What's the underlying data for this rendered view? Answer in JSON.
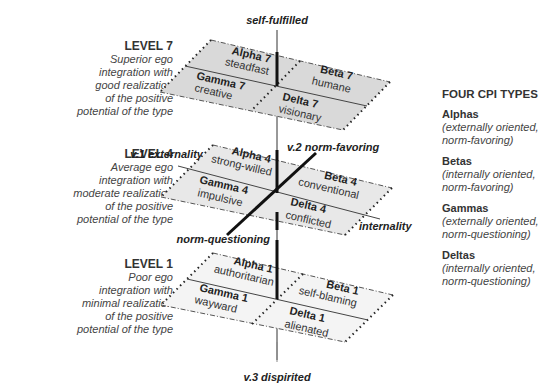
{
  "levels": [
    {
      "title": "LEVEL 7",
      "desc": [
        "Superior ego",
        "integration with",
        "good realization",
        "of the positive",
        "potential of the type"
      ]
    },
    {
      "title": "LEVEL 4",
      "desc": [
        "Average ego",
        "integration with",
        "moderate realization",
        "of the positive",
        "potential of the type"
      ]
    },
    {
      "title": "LEVEL 1",
      "desc": [
        "Poor ego",
        "integration with",
        "minimal realization",
        "of the positive",
        "potential of the type"
      ]
    }
  ],
  "planes": {
    "level7": {
      "alpha": {
        "title": "Alpha 7",
        "sub": "steadfast"
      },
      "beta": {
        "title": "Beta 7",
        "sub": "humane"
      },
      "gamma": {
        "title": "Gamma 7",
        "sub": "creative"
      },
      "delta": {
        "title": "Delta 7",
        "sub": "visionary"
      },
      "fill": "#d9d9d9"
    },
    "level4": {
      "alpha": {
        "title": "Alpha 4",
        "sub": "strong-willed"
      },
      "beta": {
        "title": "Beta 4",
        "sub": "conventional"
      },
      "gamma": {
        "title": "Gamma 4",
        "sub": "impulsive"
      },
      "delta": {
        "title": "Delta 4",
        "sub": "conflicted"
      },
      "fill": "#e6e6e6"
    },
    "level1": {
      "alpha": {
        "title": "Alpha 1",
        "sub": "authoritarian"
      },
      "beta": {
        "title": "Beta 1",
        "sub": "self-blaming"
      },
      "gamma": {
        "title": "Gamma 1",
        "sub": "wayward"
      },
      "delta": {
        "title": "Delta 1",
        "sub": "alienated"
      },
      "fill": "#f3f3f3"
    }
  },
  "axes": {
    "top": "self-fulfilled",
    "bottom": "v.3 dispirited",
    "externality": "v.1 externality",
    "internality": "internality",
    "norm_favoring": "v.2 norm-favoring",
    "norm_questioning": "norm-questioning"
  },
  "legend": {
    "heading": "FOUR CPI TYPES",
    "items": [
      {
        "name": "Alphas",
        "desc": [
          "(externally oriented,",
          "norm-favoring)"
        ]
      },
      {
        "name": "Betas",
        "desc": [
          "(internally oriented,",
          "norm-favoring)"
        ]
      },
      {
        "name": "Gammas",
        "desc": [
          "(externally oriented,",
          "norm-questioning)"
        ]
      },
      {
        "name": "Deltas",
        "desc": [
          "(internally oriented,",
          "norm-questioning)"
        ]
      }
    ]
  }
}
